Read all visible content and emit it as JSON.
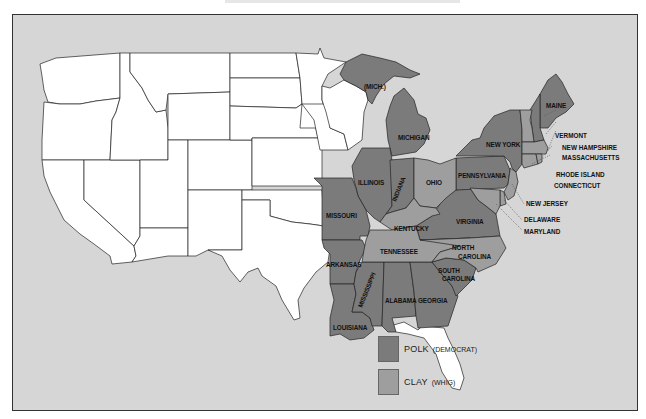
{
  "colors": {
    "background": "#d6d6d6",
    "unvoted": "#ffffff",
    "polk": "#7b7b7b",
    "clay": "#9e9e9e",
    "border": "#222222"
  },
  "legend": {
    "items": [
      {
        "candidate": "POLK",
        "party": "(DEMOCRAT)",
        "color": "#7b7b7b"
      },
      {
        "candidate": "CLAY",
        "party": "(WHIG)",
        "color": "#9e9e9e"
      }
    ]
  },
  "states": {
    "polk": [
      "MAINE",
      "NEW YORK",
      "PENNSYLVANIA",
      "MICHIGAN",
      "(MICH.)",
      "INDIANA",
      "ILLINOIS",
      "MISSOURI",
      "VIRGINIA",
      "ARKANSAS",
      "LOUISIANA",
      "MISSISSIPPI",
      "ALABAMA",
      "GEORGIA",
      "SOUTH CAROLINA",
      "NEW HAMPSHIRE"
    ],
    "clay": [
      "OHIO",
      "KENTUCKY",
      "TENNESSEE",
      "NORTH CAROLINA",
      "VERMONT",
      "MASSACHUSETTS",
      "RHODE ISLAND",
      "CONNECTICUT",
      "NEW JERSEY",
      "DELAWARE",
      "MARYLAND"
    ]
  },
  "labels": {
    "mich_up": "(MICH.)",
    "michigan": "MICHIGAN",
    "illinois": "ILLINOIS",
    "indiana": "INDIANA",
    "ohio": "OHIO",
    "missouri": "MISSOURI",
    "kentucky": "KENTUCKY",
    "tennessee": "TENNESSEE",
    "arkansas": "ARKANSAS",
    "mississippi": "MISSISSIPPI",
    "alabama": "ALABAMA",
    "georgia": "GEORGIA",
    "louisiana": "LOUISIANA",
    "south_carolina_1": "SOUTH",
    "south_carolina_2": "CAROLINA",
    "north_carolina_1": "NORTH",
    "north_carolina_2": "CAROLINA",
    "virginia": "VIRGINIA",
    "pennsylvania": "PENNSYLVANIA",
    "new_york": "NEW YORK",
    "maine": "MAINE",
    "vermont": "VERMONT",
    "new_hampshire": "NEW HAMPSHIRE",
    "massachusetts": "MASSACHUSETTS",
    "rhode_island": "RHODE ISLAND",
    "connecticut": "CONNECTICUT",
    "new_jersey": "NEW JERSEY",
    "delaware": "DELAWARE",
    "maryland": "MARYLAND"
  }
}
